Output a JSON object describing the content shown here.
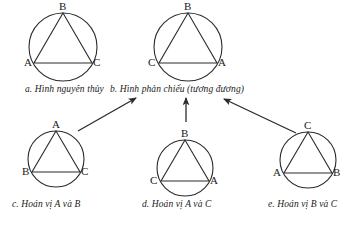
{
  "diagram": {
    "title_text_language": "Vietnamese",
    "stroke_color": "#2b2b2b",
    "text_color": "#1a1a1a",
    "background_color": "#ffffff",
    "figures": [
      {
        "id": "a",
        "caption": "a. Hình nguyên thủy",
        "vertices": {
          "top": "B",
          "bottom_left": "A",
          "bottom_right": "C"
        }
      },
      {
        "id": "b",
        "caption": "b. Hình phản chiếu (tương đương)",
        "vertices": {
          "top": "B",
          "bottom_left": "C",
          "bottom_right": "A"
        }
      },
      {
        "id": "c",
        "caption": "c. Hoán vị A và B",
        "vertices": {
          "top": "A",
          "bottom_left": "B",
          "bottom_right": "C"
        }
      },
      {
        "id": "d",
        "caption": "d. Hoán vị A và C",
        "vertices": {
          "top": "B",
          "bottom_left": "C",
          "bottom_right": "A"
        }
      },
      {
        "id": "e",
        "caption": "e. Hoán vị B và C",
        "vertices": {
          "top": "C",
          "bottom_left": "A",
          "bottom_right": "B"
        }
      }
    ],
    "arrows": [
      {
        "name": "arrow-c-to-b",
        "from_figure": "c",
        "to_figure": "b"
      },
      {
        "name": "arrow-d-to-b",
        "from_figure": "d",
        "to_figure": "b"
      },
      {
        "name": "arrow-e-to-b",
        "from_figure": "e",
        "to_figure": "b"
      }
    ]
  }
}
